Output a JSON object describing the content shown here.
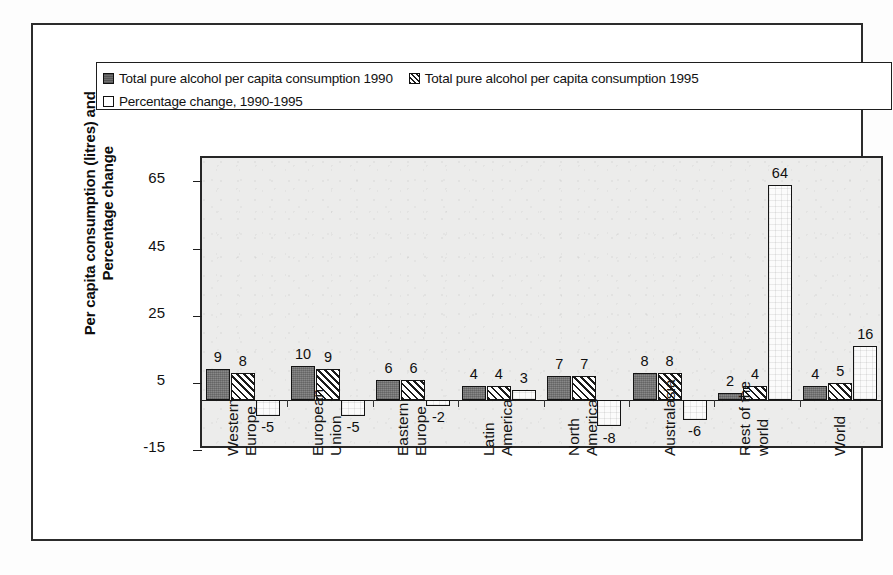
{
  "legend": {
    "entries": [
      {
        "label": "Total pure alcohol per capita consumption  1990",
        "marker": "solid-dark-square-icon"
      },
      {
        "label": "Total pure alcohol per capita consumption  1995",
        "marker": "diagonal-hatch-square-icon"
      },
      {
        "label": "Percentage change, 1990-1995",
        "marker": "open-white-square-icon"
      }
    ]
  },
  "axis": {
    "ytitle_line1": "Per capita consumption (litres) and",
    "ytitle_line2": "Percentage change",
    "yticks": [
      "65",
      "45",
      "25",
      "5",
      "-15"
    ]
  },
  "caption": {
    "text": "Figure 1. Per capita alcohol consumption, 1990 and 1995, and % change"
  },
  "chart_data": {
    "type": "bar",
    "title": "",
    "xlabel": "",
    "ylabel": "Per capita consumption (litres) and Percentage change",
    "ylim": [
      -15,
      72
    ],
    "ytick_values": [
      65,
      45,
      25,
      5,
      -15
    ],
    "grid": false,
    "legend_position": "top",
    "categories": [
      "Western Europe",
      "European Union",
      "Eastern Europe",
      "Latin America",
      "North America",
      "Australasia",
      "Rest of the world",
      "World"
    ],
    "category_lines": [
      [
        "Western",
        "Europe"
      ],
      [
        "European",
        "Union"
      ],
      [
        "Eastern",
        "Europe"
      ],
      [
        "Latin",
        "America"
      ],
      [
        "North",
        "America"
      ],
      [
        "Australasia"
      ],
      [
        "Rest of the",
        "world"
      ],
      [
        "World"
      ]
    ],
    "series": [
      {
        "name": "Total pure alcohol per capita consumption  1990",
        "pattern": "solid-dark",
        "values": [
          9,
          10,
          6,
          4,
          7,
          8,
          2,
          4
        ]
      },
      {
        "name": "Total pure alcohol per capita consumption  1995",
        "pattern": "diagonal-hatch",
        "values": [
          8,
          9,
          6,
          4,
          7,
          8,
          4,
          5
        ]
      },
      {
        "name": "Percentage change, 1990-1995",
        "pattern": "open-white",
        "values": [
          -5,
          -5,
          -2,
          3,
          -8,
          -6,
          64,
          16
        ]
      }
    ]
  },
  "colors": {
    "series_1990": "#787878",
    "series_1995": "#ffffff",
    "series_pct": "#fbfbfb",
    "outline": "#141414",
    "plot_background": "#ececeb",
    "frame": "#2c2c2c"
  }
}
